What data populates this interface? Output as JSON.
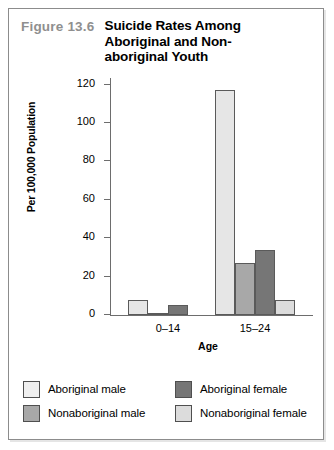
{
  "figure": {
    "number": "Figure 13.6",
    "title_lines": [
      "Suicide Rates Among",
      "Aboriginal and Non-",
      "aboriginal Youth"
    ]
  },
  "chart_data": {
    "type": "bar",
    "xlabel": "Age",
    "ylabel": "Per 100,000 Population",
    "categories": [
      "0–14",
      "15–24"
    ],
    "yticks": [
      0,
      20,
      40,
      60,
      80,
      100,
      120
    ],
    "ylim": [
      0,
      124
    ],
    "grid": false,
    "legend_position": "bottom",
    "series": [
      {
        "name": "Aboriginal male",
        "color": "#e6e6e6",
        "values": [
          8,
          117
        ]
      },
      {
        "name": "Nonaboriginal male",
        "color": "#a8a8a8",
        "values": [
          0.6,
          27
        ]
      },
      {
        "name": "Aboriginal female",
        "color": "#767676",
        "values": [
          5,
          34
        ]
      },
      {
        "name": "Nonaboriginal female",
        "color": "#dcdcdc",
        "values": [
          0,
          8
        ]
      }
    ]
  },
  "legend": {
    "items": [
      {
        "label": "Aboriginal male",
        "color": "#efefef"
      },
      {
        "label": "Aboriginal  female",
        "color": "#767676"
      },
      {
        "label": "Nonaboriginal male",
        "color": "#a8a8a8"
      },
      {
        "label": "Nonaboriginal female",
        "color": "#dcdcdc"
      }
    ]
  }
}
